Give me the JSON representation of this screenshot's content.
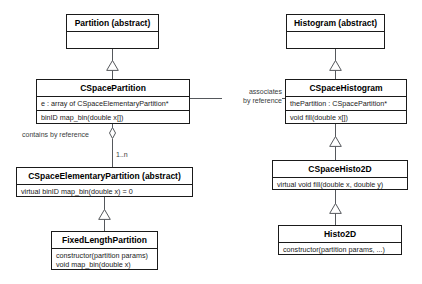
{
  "diagram": {
    "colors": {
      "box_border": "#1a1a1a",
      "line": "#55585c",
      "background": "#ffffff",
      "text": "#000000"
    },
    "classes": {
      "partition": {
        "name": "Partition (abstract)",
        "members": []
      },
      "histogram": {
        "name": "Histogram (abstract)",
        "members": []
      },
      "cspace_partition": {
        "name": "CSpacePartition",
        "attributes": [
          "e : array of CSpaceElementaryPartition*"
        ],
        "operations": [
          "binID map_bin(double x[])"
        ]
      },
      "cspace_histogram": {
        "name": "CSpaceHistogram",
        "attributes": [
          "thePartition : CSpacePartition*"
        ],
        "operations": [
          "void fill(double x[])"
        ]
      },
      "cspace_elementary_partition": {
        "name": "CSpaceElementaryPartition (abstract)",
        "operations": [
          "virtual binID map_bin(double x) = 0"
        ]
      },
      "cspace_histo2d": {
        "name": "CSpaceHisto2D",
        "operations": [
          "virtual void fill(double x, double y)"
        ]
      },
      "fixed_length_partition": {
        "name": "FixedLengthPartition",
        "operations": [
          "constructor(partition params)",
          "void map_bin(double x)"
        ]
      },
      "histo2d": {
        "name": "Histo2D",
        "operations": [
          "constructor(partition params, ...)"
        ]
      }
    },
    "edge_labels": {
      "associates_line1": "associates",
      "associates_line2": "by reference",
      "contains_by_reference": "contains by reference",
      "multiplicity": "1..n"
    }
  }
}
